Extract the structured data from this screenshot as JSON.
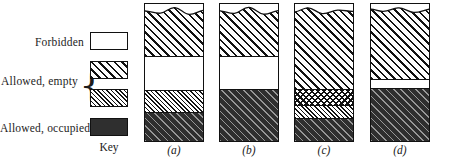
{
  "figure": {
    "type": "diagram",
    "key_caption": "Key",
    "legend": {
      "items": [
        {
          "label": "Forbidden",
          "swatch": "white-box",
          "pattern": "white",
          "meaning": "forbidden band (energy gap)"
        },
        {
          "label": "Allowed, empty",
          "swatch": "coarse-hatch-box",
          "pattern": "coarse-hatch",
          "meaning": "allowed band, empty"
        },
        {
          "label": "Allowed, empty",
          "swatch": "fine-hatch-box",
          "pattern": "fine-hatch",
          "meaning": "allowed band, empty"
        },
        {
          "label": "Allowed, occupied",
          "swatch": "solid-dark-box",
          "pattern": "dark",
          "meaning": "allowed band, occupied"
        }
      ],
      "brace_glyph": "{",
      "brace_groups": "coarse-hatch and fine-hatch are braced together as 'Allowed, empty'"
    },
    "bars": [
      {
        "caption": "(a)",
        "has_break_at_top": true,
        "layers": [
          {
            "pattern": "coarse-hatch",
            "height_pct": 38,
            "meaning": "allowed, empty"
          },
          {
            "pattern": "white",
            "height_pct": 25,
            "meaning": "forbidden"
          },
          {
            "pattern": "fine-hatch",
            "height_pct": 16,
            "meaning": "allowed, empty"
          },
          {
            "pattern": "dark",
            "height_pct": 21,
            "meaning": "allowed, occupied"
          }
        ]
      },
      {
        "caption": "(b)",
        "has_break_at_top": true,
        "layers": [
          {
            "pattern": "coarse-hatch",
            "height_pct": 38,
            "meaning": "allowed, empty"
          },
          {
            "pattern": "white",
            "height_pct": 24,
            "meaning": "forbidden"
          },
          {
            "pattern": "dark",
            "height_pct": 38,
            "meaning": "allowed, occupied"
          }
        ]
      },
      {
        "caption": "(c)",
        "has_break_at_top": true,
        "layers": [
          {
            "pattern": "coarse-hatch",
            "height_pct": 62,
            "meaning": "allowed, empty"
          },
          {
            "pattern": "mesh",
            "height_pct": 12,
            "meaning": "allowed, partly occupied"
          },
          {
            "pattern": "fine-hatch",
            "height_pct": 9,
            "meaning": "allowed, empty"
          },
          {
            "pattern": "dark",
            "height_pct": 17,
            "meaning": "allowed, occupied"
          }
        ]
      },
      {
        "caption": "(d)",
        "has_break_at_top": true,
        "layers": [
          {
            "pattern": "coarse-hatch",
            "height_pct": 55,
            "meaning": "allowed, empty"
          },
          {
            "pattern": "white",
            "height_pct": 6,
            "meaning": "forbidden"
          },
          {
            "pattern": "dark",
            "height_pct": 39,
            "meaning": "allowed, occupied"
          }
        ]
      }
    ]
  },
  "colors": {
    "ink": "#111111",
    "paper": "#ffffff",
    "occupied_fill": "#2f2f2f"
  }
}
